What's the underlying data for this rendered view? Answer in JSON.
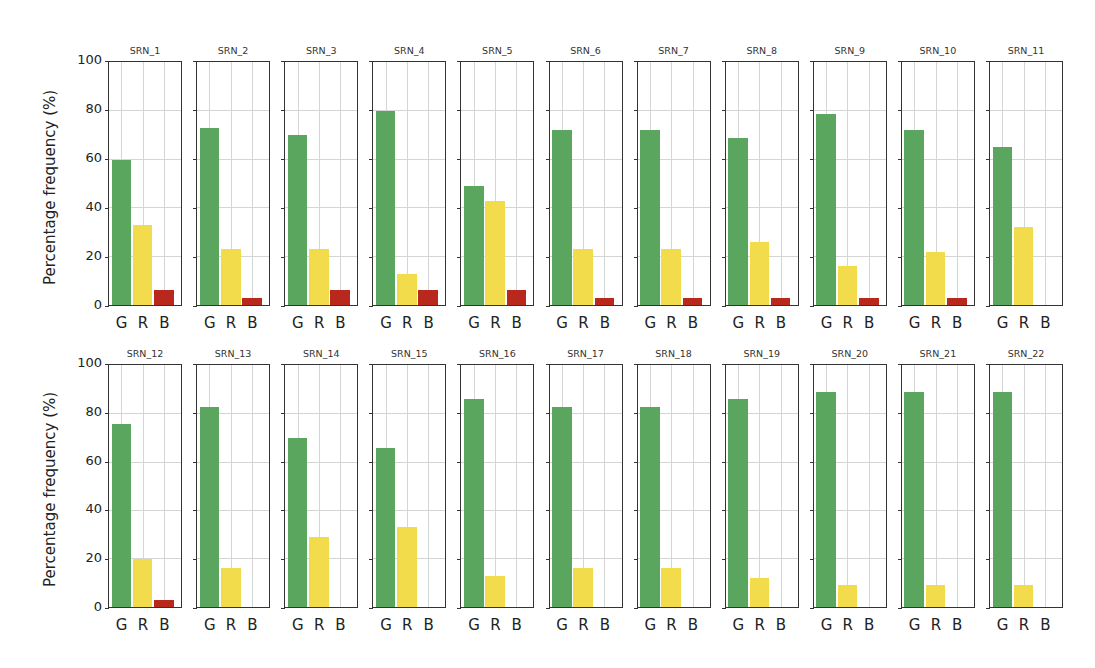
{
  "figure": {
    "ylabel": "Percentage frequency (%)",
    "yticks": [
      "0",
      "20",
      "40",
      "60",
      "80",
      "100"
    ],
    "categories": [
      "G",
      "R",
      "B"
    ],
    "colors": {
      "G": "#5aa65e",
      "R": "#f2dc4c",
      "B": "#b8281c"
    }
  },
  "chart_data": {
    "type": "bar",
    "title": "",
    "xlabel": "",
    "ylabel": "Percentage frequency (%)",
    "ylim": [
      0,
      100
    ],
    "grid": true,
    "layout": "2 rows x 11 small-multiple panels",
    "categories": [
      "G",
      "R",
      "B"
    ],
    "panels": [
      {
        "title": "SRN_1",
        "values": [
          60,
          33,
          6
        ]
      },
      {
        "title": "SRN_2",
        "values": [
          73,
          23,
          3
        ]
      },
      {
        "title": "SRN_3",
        "values": [
          70,
          23,
          6
        ]
      },
      {
        "title": "SRN_4",
        "values": [
          80,
          13,
          6
        ]
      },
      {
        "title": "SRN_5",
        "values": [
          49,
          43,
          6
        ]
      },
      {
        "title": "SRN_6",
        "values": [
          72,
          23,
          3
        ]
      },
      {
        "title": "SRN_7",
        "values": [
          72,
          23,
          3
        ]
      },
      {
        "title": "SRN_8",
        "values": [
          69,
          26,
          3
        ]
      },
      {
        "title": "SRN_9",
        "values": [
          79,
          16,
          3
        ]
      },
      {
        "title": "SRN_10",
        "values": [
          72,
          22,
          3
        ]
      },
      {
        "title": "SRN_11",
        "values": [
          65,
          32,
          0
        ]
      },
      {
        "title": "SRN_12",
        "values": [
          76,
          20,
          3
        ]
      },
      {
        "title": "SRN_13",
        "values": [
          83,
          16,
          0
        ]
      },
      {
        "title": "SRN_14",
        "values": [
          70,
          29,
          0
        ]
      },
      {
        "title": "SRN_15",
        "values": [
          66,
          33,
          0
        ]
      },
      {
        "title": "SRN_16",
        "values": [
          86,
          13,
          0
        ]
      },
      {
        "title": "SRN_17",
        "values": [
          83,
          16,
          0
        ]
      },
      {
        "title": "SRN_18",
        "values": [
          83,
          16,
          0
        ]
      },
      {
        "title": "SRN_19",
        "values": [
          86,
          12,
          0
        ]
      },
      {
        "title": "SRN_20",
        "values": [
          89,
          9,
          0
        ]
      },
      {
        "title": "SRN_21",
        "values": [
          89,
          9,
          0
        ]
      },
      {
        "title": "SRN_22",
        "values": [
          89,
          9,
          0
        ]
      }
    ]
  }
}
